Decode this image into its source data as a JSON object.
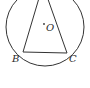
{
  "figure": {
    "type": "geometry",
    "stroke_color": "#333333",
    "circle": {
      "center": "O",
      "cx": 45,
      "cy": 27,
      "r": 39
    },
    "points": {
      "A": {
        "x": 43,
        "y": -12
      },
      "B": {
        "x": 23,
        "y": 52
      },
      "C": {
        "x": 67,
        "y": 53
      },
      "O": {
        "x": 44,
        "y": 25
      }
    },
    "labels": {
      "B": "B",
      "C": "C",
      "O": "O"
    },
    "segments": [
      "AB",
      "AC",
      "BC"
    ]
  }
}
